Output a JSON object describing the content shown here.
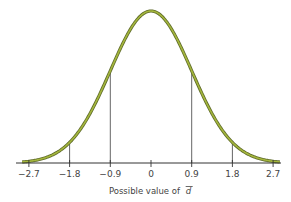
{
  "chart_data": {
    "type": "line",
    "subtype": "normal-distribution-curve",
    "title": "",
    "xlabel": "Possible value of d̄",
    "xlabel_text": "Possible value of",
    "xlabel_symbol": "d",
    "ylabel": "",
    "xlim": [
      -3.0,
      3.0
    ],
    "x_ticks": [
      -2.7,
      -1.8,
      -0.9,
      0,
      0.9,
      1.8,
      2.7
    ],
    "x_tick_labels": [
      "−2.7",
      "−1.8",
      "−0.9",
      "0",
      "0.9",
      "1.8",
      "2.7"
    ],
    "distribution": {
      "mean": 0,
      "sd": 0.9
    },
    "vertical_reference_lines": [
      -1.8,
      -0.9,
      0.9,
      1.8
    ],
    "grid": false,
    "legend": null,
    "colors": {
      "curve": "#a4b63c",
      "curve_outline": "#5f6b2a",
      "axis": "#333333",
      "ref_lines": "#555555"
    }
  }
}
